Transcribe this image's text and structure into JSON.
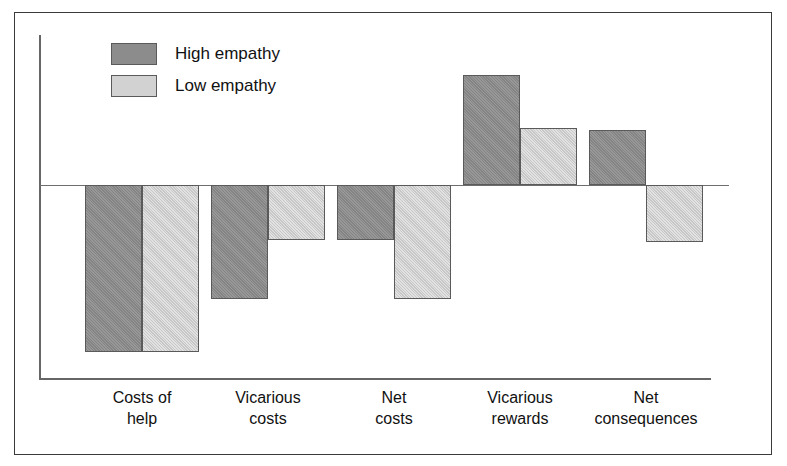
{
  "chart_data": {
    "type": "bar",
    "title": "",
    "subtitle": "",
    "xlabel": "",
    "ylabel": "",
    "orientation": "vertical",
    "grouping": "grouped",
    "grid": false,
    "legend_position": "top-left",
    "zero_line": true,
    "ylim": [
      -8.5,
      6.5
    ],
    "categories": [
      "Costs of help",
      "Vicarious costs",
      "Net costs",
      "Vicarious rewards",
      "Net consequences"
    ],
    "category_lines": [
      [
        "Costs of",
        "help"
      ],
      [
        "Vicarious",
        "costs"
      ],
      [
        "Net",
        "costs"
      ],
      [
        "Vicarious",
        "rewards"
      ],
      [
        "Net",
        "consequences"
      ]
    ],
    "series": [
      {
        "name": "High empathy",
        "color": "#8c8c8c",
        "values": [
          -7.6,
          -5.2,
          -2.5,
          5.0,
          2.5
        ]
      },
      {
        "name": "Low empathy",
        "color": "#d2d2d2",
        "values": [
          -7.6,
          -2.5,
          -5.2,
          2.6,
          -2.6
        ]
      }
    ]
  },
  "legend": {
    "items": [
      {
        "label": "High empathy",
        "swatch": "#8c8c8c"
      },
      {
        "label": "Low empathy",
        "swatch": "#d2d2d2"
      }
    ]
  },
  "colors": {
    "high_empathy": "#8c8c8c",
    "low_empathy": "#d2d2d2",
    "axis": "#666666",
    "frame": "#3a3a3a",
    "text": "#111111",
    "background": "#ffffff"
  }
}
